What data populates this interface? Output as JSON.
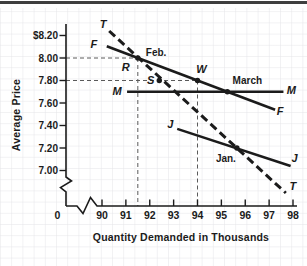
{
  "chart_data": {
    "type": "line",
    "title": "",
    "xlabel": "Quantity Demanded in Thousands",
    "ylabel": "Average Price",
    "xlim": [
      90,
      98
    ],
    "ylim": [
      7.0,
      8.2
    ],
    "grid": true,
    "origin_label": "0",
    "axis_breaks": {
      "x_axis": true,
      "y_axis": true
    },
    "x_ticks": [
      90,
      91,
      92,
      93,
      94,
      95,
      96,
      97,
      98
    ],
    "y_ticks": [
      {
        "value": 8.2,
        "label": "$8.20"
      },
      {
        "value": 8.0,
        "label": "8.00"
      },
      {
        "value": 7.8,
        "label": "7.80"
      },
      {
        "value": 7.6,
        "label": "7.60"
      },
      {
        "value": 7.4,
        "label": "7.40"
      },
      {
        "value": 7.2,
        "label": "7.20"
      },
      {
        "value": 7.0,
        "label": "7.00"
      }
    ],
    "series": [
      {
        "name": "T",
        "label": "T",
        "style": "dashed",
        "points": [
          [
            90.3,
            8.24
          ],
          [
            97.7,
            6.8
          ]
        ]
      },
      {
        "name": "F",
        "label": "F",
        "style": "solid",
        "points": [
          [
            90.2,
            8.105
          ],
          [
            97.25,
            7.54
          ]
        ]
      },
      {
        "name": "M",
        "label": "M",
        "style": "solid",
        "points": [
          [
            91.05,
            7.7
          ],
          [
            97.6,
            7.7
          ]
        ]
      },
      {
        "name": "J",
        "label": "J",
        "style": "solid",
        "points": [
          [
            93.15,
            7.37
          ],
          [
            97.9,
            7.04
          ]
        ]
      }
    ],
    "marked_points": [
      {
        "label": "Feb.",
        "x": 91.5,
        "y": 8.0,
        "dot": true
      },
      {
        "label": "S",
        "x": 92.4,
        "y": 7.8,
        "dot": true
      },
      {
        "label": "W",
        "x": 94.0,
        "y": 7.8,
        "dot": true
      },
      {
        "label": "March",
        "x": 95.25,
        "y": 7.7,
        "dot": true
      },
      {
        "label": "Jan.",
        "x": 95.65,
        "y": 7.2,
        "dot": true
      },
      {
        "label": "R",
        "x": 91.5,
        "y": 8.0,
        "dot": false
      }
    ],
    "guide_lines": [
      {
        "price": 8.0,
        "quantity": 91.5
      },
      {
        "price": 7.8,
        "quantity": 94.0
      }
    ],
    "colors": {
      "ink": "#1b1b1b",
      "grid": "#e4e4e8",
      "guide": "#5a5a5a",
      "top_border": "#3f3f3f"
    }
  }
}
